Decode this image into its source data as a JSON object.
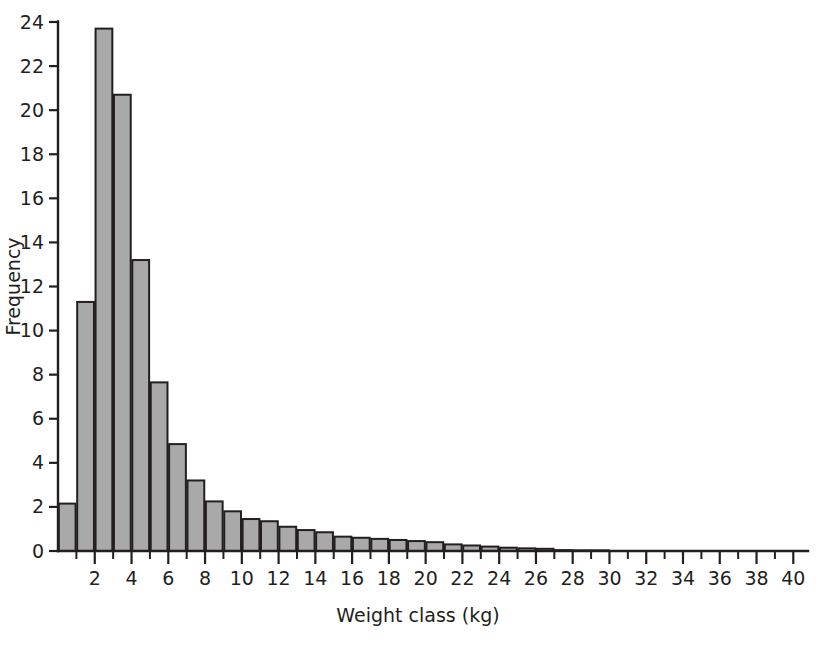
{
  "chart_data": {
    "type": "bar",
    "title": "",
    "subtitle": "",
    "xlabel": "Weight class (kg)",
    "ylabel": "Frequency",
    "xlim": [
      0,
      40.8
    ],
    "ylim": [
      0,
      24.6
    ],
    "grid": false,
    "legend": null,
    "bar_color": "#a9a9a9",
    "bar_edge_color": "#231f20",
    "axis_color": "#231f20",
    "background_color": "#ffffff",
    "x_tick_interval": 1,
    "x_labeled_interval": 2,
    "y_tick_interval": 2,
    "x_ticks": [
      1,
      2,
      3,
      4,
      5,
      6,
      7,
      8,
      9,
      10,
      11,
      12,
      13,
      14,
      15,
      16,
      17,
      18,
      19,
      20,
      21,
      22,
      23,
      24,
      25,
      26,
      27,
      28,
      29,
      30,
      31,
      32,
      33,
      34,
      35,
      36,
      37,
      38,
      39,
      40
    ],
    "x_tick_labels": [
      "2",
      "4",
      "6",
      "8",
      "10",
      "12",
      "14",
      "16",
      "18",
      "20",
      "22",
      "24",
      "26",
      "28",
      "30",
      "32",
      "34",
      "36",
      "38",
      "40"
    ],
    "x_labeled_values": [
      2,
      4,
      6,
      8,
      10,
      12,
      14,
      16,
      18,
      20,
      22,
      24,
      26,
      28,
      30,
      32,
      34,
      36,
      38,
      40
    ],
    "y_ticks": [
      0,
      2,
      4,
      6,
      8,
      10,
      12,
      14,
      16,
      18,
      20,
      22,
      24
    ],
    "y_tick_labels": [
      "0",
      "2",
      "4",
      "6",
      "8",
      "10",
      "12",
      "14",
      "16",
      "18",
      "20",
      "22",
      "24"
    ],
    "categories": [
      1,
      2,
      3,
      4,
      5,
      6,
      7,
      8,
      9,
      10,
      11,
      12,
      13,
      14,
      15,
      16,
      17,
      18,
      19,
      20,
      21,
      22,
      23,
      24,
      25,
      26,
      27,
      28,
      29,
      30,
      31,
      32,
      33,
      34,
      35,
      36,
      37,
      38,
      39,
      40
    ],
    "values": [
      2.15,
      11.3,
      23.7,
      20.7,
      13.2,
      7.65,
      4.85,
      3.2,
      2.25,
      1.8,
      1.45,
      1.35,
      1.1,
      0.95,
      0.85,
      0.65,
      0.6,
      0.55,
      0.5,
      0.45,
      0.4,
      0.3,
      0.25,
      0.2,
      0.15,
      0.12,
      0.1,
      0.04,
      0.03,
      0.03,
      0.0,
      0.0,
      0.0,
      0.0,
      0.0,
      0.0,
      0.0,
      0.0,
      0.0,
      0.0
    ]
  }
}
